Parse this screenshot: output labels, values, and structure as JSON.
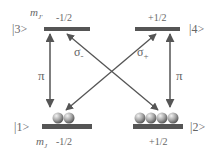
{
  "diagram": {
    "type": "energy-level-diagram",
    "colors": {
      "level_bar": "#555555",
      "arrow": "#555555",
      "text": "#666666",
      "ball_light": "#e0e0e0",
      "ball_dark": "#6e6e6e"
    },
    "levels": [
      {
        "id": "3",
        "ket": "|3>",
        "mj": "-1/2",
        "position": "top-left",
        "population": 0
      },
      {
        "id": "4",
        "ket": "|4>",
        "mj": "+1/2",
        "position": "top-right",
        "population": 0
      },
      {
        "id": "1",
        "ket": "|1>",
        "mj": "-1/2",
        "position": "bottom-left",
        "population": 2
      },
      {
        "id": "2",
        "ket": "|2>",
        "mj": "+1/2",
        "position": "bottom-right",
        "population": 4
      }
    ],
    "mj_label_top": "m",
    "mj_label_top_sub": "J'",
    "mj_label_bottom": "m",
    "mj_label_bottom_sub": "J",
    "transitions": [
      {
        "from": "1",
        "to": "3",
        "label": "π",
        "sub": "",
        "style": "double-arrow-vertical"
      },
      {
        "from": "2",
        "to": "4",
        "label": "π",
        "sub": "",
        "style": "double-arrow-vertical"
      },
      {
        "from": "2",
        "to": "3",
        "label": "σ",
        "sub": "-",
        "style": "double-arrow-diagonal"
      },
      {
        "from": "1",
        "to": "4",
        "label": "σ",
        "sub": "+",
        "style": "double-arrow-diagonal"
      }
    ]
  }
}
